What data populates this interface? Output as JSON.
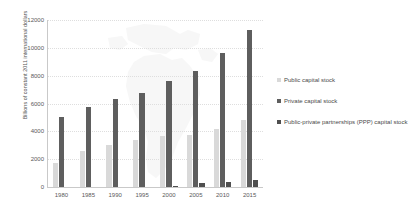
{
  "chart_data": {
    "type": "bar",
    "title": "",
    "subtitle": "",
    "xlabel": "",
    "ylabel": "Billions of constant 2011 international dollars",
    "categories": [
      "1980",
      "1985",
      "1990",
      "1995",
      "2000",
      "2005",
      "2010",
      "2015"
    ],
    "series": [
      {
        "name": "Public capital stock",
        "color": "#d9d9d9",
        "values": [
          1750,
          2600,
          3000,
          3400,
          3700,
          3750,
          4150,
          4850
        ]
      },
      {
        "name": "Private capital stock",
        "color": "#5e5e5e",
        "values": [
          5050,
          5750,
          6350,
          6750,
          7600,
          8350,
          9650,
          11300
        ]
      },
      {
        "name": "Public-private partnerships (PPP) capital stock",
        "color": "#4f4f4f",
        "values": [
          0,
          0,
          0,
          0,
          100,
          300,
          330,
          500
        ]
      }
    ],
    "ylim": [
      0,
      12000
    ],
    "yticks": [
      0,
      2000,
      4000,
      6000,
      8000,
      10000,
      12000
    ],
    "ytick_labels": [
      "0",
      "2000",
      "4000",
      "6000",
      "8000",
      "10000",
      "12000"
    ],
    "grid": true,
    "legend_position": "right",
    "background_watermark": "south-america-map"
  },
  "legend": {
    "items": [
      {
        "label": "Public capital stock",
        "color": "#d9d9d9"
      },
      {
        "label": "Private capital stock",
        "color": "#5e5e5e"
      },
      {
        "label": "Public-private partnerships (PPP) capital stock",
        "color": "#4f4f4f"
      }
    ]
  }
}
